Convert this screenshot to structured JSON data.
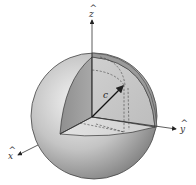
{
  "diagram": {
    "axes": {
      "z": {
        "label": "z",
        "hat": "^"
      },
      "y": {
        "label": "y",
        "hat": "^"
      },
      "x": {
        "label": "x",
        "hat": "^"
      }
    },
    "vector": {
      "label": "c"
    },
    "colors": {
      "sphere_light": "#f2f2f2",
      "sphere_dark": "#8a8a8a",
      "cut_face_dark": "#9c9c9c",
      "cut_face_mid": "#c8c8c8",
      "cut_face_floor": "#dcdcdc",
      "outline": "#333333"
    }
  }
}
